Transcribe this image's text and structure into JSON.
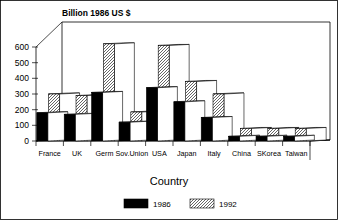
{
  "chart_data": {
    "type": "bar",
    "title": "Billion 1986 US $",
    "xlabel": "Country",
    "ylabel": "",
    "categories": [
      "France",
      "UK",
      "Germ",
      "Sov.Union",
      "USA",
      "Japan",
      "Italy",
      "China",
      "SKorea",
      "Taiwan"
    ],
    "series": [
      {
        "name": "1986",
        "values": [
          180,
          170,
          310,
          120,
          340,
          250,
          150,
          30,
          30,
          30
        ],
        "color": "#000000",
        "pattern": "solid"
      },
      {
        "name": "1992",
        "values": [
          300,
          290,
          620,
          185,
          610,
          380,
          300,
          80,
          80,
          80
        ],
        "color": "#ffffff",
        "pattern": "hatched"
      }
    ],
    "yticks": [
      0,
      100,
      200,
      300,
      400,
      500,
      600
    ],
    "ylim": [
      0,
      660
    ],
    "grid": false,
    "legend_position": "bottom",
    "projection": "3d-bar"
  },
  "title": {
    "text": "Billion 1986 US $"
  },
  "axes": {
    "x_title": "Country",
    "y_ticks": [
      "600",
      "500",
      "400",
      "300",
      "200",
      "100",
      "0"
    ],
    "x_categories": [
      "France",
      "UK",
      "Germ",
      "Sov.Union",
      "USA",
      "Japan",
      "Italy",
      "China",
      "SKorea",
      "Taiwan"
    ]
  },
  "legend": {
    "entries": [
      {
        "label": "1986",
        "swatch": "solid-black-swatch"
      },
      {
        "label": "1992",
        "swatch": "hatched-swatch"
      }
    ]
  }
}
